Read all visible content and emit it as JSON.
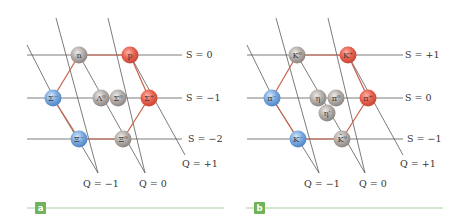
{
  "colors": {
    "positive": "#e8604e",
    "negative": "#6fa3dc",
    "neutral": "#a9a3a0",
    "hexagon_edge": "#c8604a",
    "grid": "#5a5a5a",
    "panel_badge": "#6fb35a",
    "panel_bar": "#a8d3a0"
  },
  "panels": [
    {
      "id": "a",
      "badge": "a",
      "title": "Baryon octet",
      "s_labels": [
        "S = 0",
        "S = −1",
        "S = −2"
      ],
      "q_labels": [
        "Q = −1",
        "Q = 0",
        "Q = +1"
      ],
      "particles": [
        {
          "symbol": "n",
          "charge_class": "neutral"
        },
        {
          "symbol": "p",
          "charge_class": "positive"
        },
        {
          "symbol": "Σ⁻",
          "charge_class": "negative"
        },
        {
          "symbol": "Λ⁰",
          "charge_class": "neutral"
        },
        {
          "symbol": "Σ⁰",
          "charge_class": "neutral"
        },
        {
          "symbol": "Σ⁺",
          "charge_class": "positive"
        },
        {
          "symbol": "Ξ⁻",
          "charge_class": "negative"
        },
        {
          "symbol": "Ξ⁰",
          "charge_class": "neutral"
        }
      ]
    },
    {
      "id": "b",
      "badge": "b",
      "title": "Meson nonet",
      "s_labels": [
        "S = +1",
        "S = 0",
        "S = −1"
      ],
      "q_labels": [
        "Q = −1",
        "Q = 0",
        "Q = +1"
      ],
      "particles": [
        {
          "symbol": "K⁰",
          "charge_class": "neutral"
        },
        {
          "symbol": "K⁺",
          "charge_class": "positive"
        },
        {
          "symbol": "π⁻",
          "charge_class": "negative"
        },
        {
          "symbol": "η",
          "charge_class": "neutral"
        },
        {
          "symbol": "π⁰",
          "charge_class": "neutral"
        },
        {
          "symbol": "η′",
          "charge_class": "neutral"
        },
        {
          "symbol": "π⁺",
          "charge_class": "positive"
        },
        {
          "symbol": "K⁻",
          "charge_class": "negative"
        },
        {
          "symbol": "K̄⁰",
          "charge_class": "neutral"
        }
      ]
    }
  ]
}
